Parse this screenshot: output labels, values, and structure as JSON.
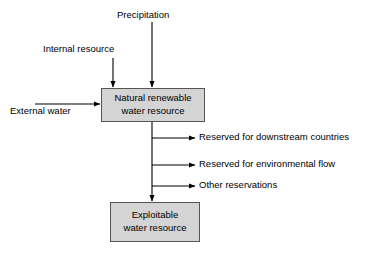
{
  "diagram": {
    "background_color": "#ffffff",
    "box_fill_color": "#d4d4d4",
    "box_border_color": "#555555",
    "arrow_color": "#000000",
    "text_color": "#000000",
    "nodes": [
      {
        "id": "natural-renewable-water-resource",
        "line1": "Natural renewable",
        "line2": "water resource"
      },
      {
        "id": "exploitable-water-resource",
        "line1": "Exploitable",
        "line2": "water resource"
      }
    ],
    "inputs": [
      {
        "id": "precipitation",
        "label": "Precipitation",
        "direction": "down"
      },
      {
        "id": "internal-resource",
        "label": "Internal resource",
        "direction": "down"
      },
      {
        "id": "external-water",
        "label": "External water",
        "direction": "right"
      }
    ],
    "outputs": [
      {
        "id": "reserved-downstream-countries",
        "label": "Reserved for downstream countries"
      },
      {
        "id": "reserved-environmental-flow",
        "label": "Reserved for environmental flow"
      },
      {
        "id": "other-reservations",
        "label": "Other reservations"
      }
    ]
  }
}
